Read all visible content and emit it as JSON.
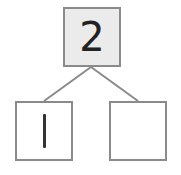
{
  "diagram": {
    "type": "number-bond",
    "whole": {
      "value": "2",
      "fill": "#ebebeb"
    },
    "parts": [
      {
        "value": "1"
      },
      {
        "value": ""
      }
    ],
    "line_color": "#8a8a8a"
  }
}
